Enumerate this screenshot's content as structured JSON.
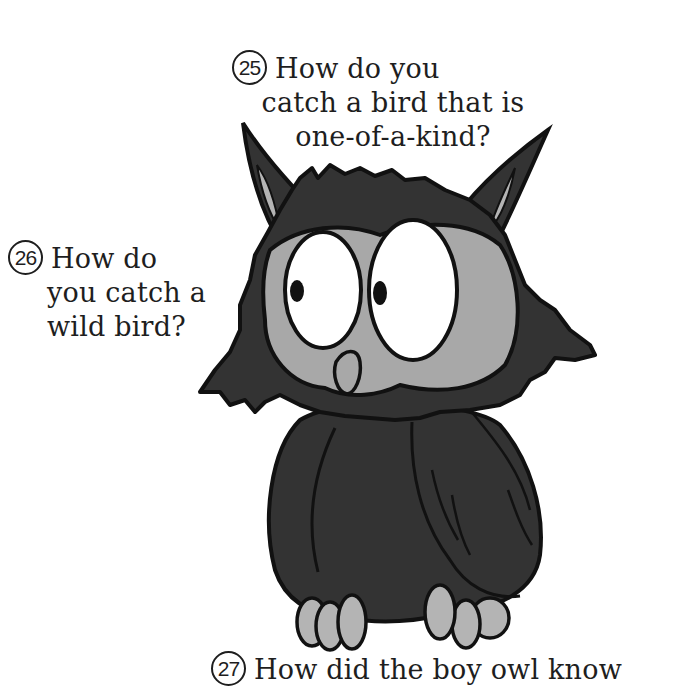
{
  "page": {
    "background": "#ffffff",
    "text_color": "#1e1e1e"
  },
  "illustration": {
    "subject": "cartoon owl with big eyes",
    "colors": {
      "body": "#333333",
      "face_disc": "#a8a8a8",
      "outline": "#111111",
      "eye_white": "#ffffff",
      "pupil": "#111111",
      "ear_inner": "#b4b4b4",
      "talons": "#b4b4b4"
    }
  },
  "riddles": [
    {
      "number": "25",
      "lines": [
        "How do you",
        "catch a bird that is",
        "one-of-a-kind?"
      ]
    },
    {
      "number": "26",
      "lines": [
        "How do",
        "you catch a",
        "wild bird?"
      ]
    },
    {
      "number": "27",
      "lines": [
        "How did the boy owl know"
      ]
    }
  ]
}
